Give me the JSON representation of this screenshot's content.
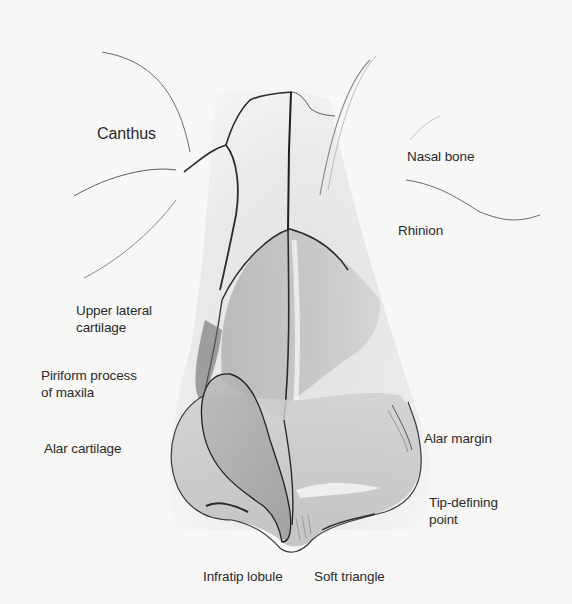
{
  "figure": {
    "labels": {
      "canthus": "Canthus",
      "nasal_bone": "Nasal bone",
      "rhinion": "Rhinion",
      "upper_lateral_cartilage": [
        "Upper lateral",
        "cartilage"
      ],
      "piriform_process": [
        "Piriform process",
        "of maxila"
      ],
      "alar_cartilage": "Alar cartilage",
      "alar_margin": "Alar margin",
      "tip_defining_point": [
        "Tip-defining",
        "point"
      ],
      "infratip_lobule": "Infratip lobule",
      "soft_triangle": "Soft triangle"
    },
    "colors": {
      "background": "#f7f7f6",
      "line": "#2b2b2b",
      "label_text": "#2a2a2a",
      "shade_dark": "#8c8c8c",
      "shade_mid": "#b5b5b5",
      "shade_light": "#d8d8d8"
    }
  }
}
